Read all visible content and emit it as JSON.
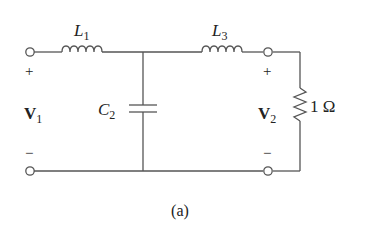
{
  "figure": {
    "caption": "(a)",
    "colors": {
      "wire": "#555555",
      "text": "#222222",
      "background": "#ffffff"
    }
  },
  "components": {
    "L1": {
      "symbol": "L",
      "sub": "1",
      "type": "inductor"
    },
    "L3": {
      "symbol": "L",
      "sub": "3",
      "type": "inductor"
    },
    "C2": {
      "symbol": "C",
      "sub": "2",
      "type": "capacitor"
    },
    "R": {
      "value": "1 Ω",
      "type": "resistor"
    }
  },
  "ports": {
    "input": {
      "symbol": "V",
      "sub": "1",
      "plus": "+",
      "minus": "−"
    },
    "output": {
      "symbol": "V",
      "sub": "2",
      "plus": "+",
      "minus": "−"
    }
  }
}
